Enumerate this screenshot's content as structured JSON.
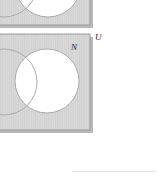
{
  "figure": {
    "type": "venn-diagram-set",
    "labels": {
      "set_label": "N",
      "universe_label": "U"
    },
    "colors": {
      "shading_fill": "#d9d9d9",
      "shading_stripe": "#cfcfcf",
      "unshaded_fill": "#ffffff",
      "rect_border": "#9a9a9a",
      "rect_shadow": "#b4b4b4",
      "circle_stroke": "#a9a9a9",
      "label_color": "#2b2b2b",
      "footer_rule": "#e3e3e8",
      "page_background": "#ffffff"
    },
    "diagrams": [
      {
        "name": "upper-diagram",
        "clipped": "true",
        "rect": {
          "x": -4,
          "y": -34,
          "width": 94,
          "height": 59
        },
        "circles": [
          {
            "name": "left-circle",
            "cx": 4,
            "cy": -16,
            "r": 33,
            "fill": "shaded"
          },
          {
            "name": "right-circle",
            "cx": 48,
            "cy": -16,
            "r": 33,
            "fill": "unshaded"
          }
        ]
      },
      {
        "name": "lower-diagram",
        "clipped": "false",
        "rect": {
          "x": -4,
          "y": 34,
          "width": 94,
          "height": 96
        },
        "circles": [
          {
            "name": "left-circle",
            "cx": 4,
            "cy": 82,
            "r": 33,
            "fill": "shaded"
          },
          {
            "name": "right-circle",
            "cx": 47,
            "cy": 81,
            "r": 32,
            "fill": "unshaded"
          }
        ]
      }
    ]
  }
}
